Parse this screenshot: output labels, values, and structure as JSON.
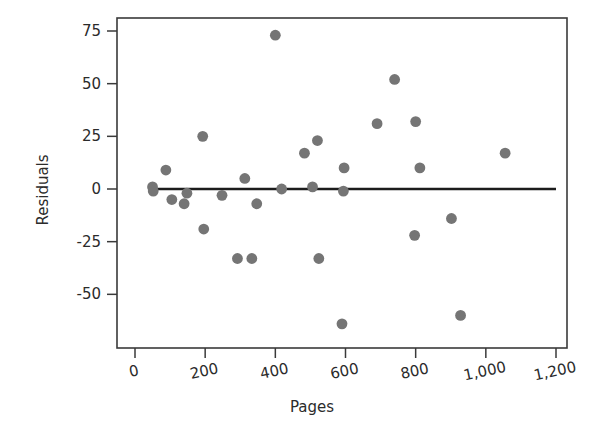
{
  "chart_data": {
    "type": "scatter",
    "title": "",
    "xlabel": "Pages",
    "ylabel": "Residuals",
    "xlim": [
      0,
      1200
    ],
    "ylim": [
      -75,
      85
    ],
    "grid": false,
    "legend": null,
    "xticks": [
      0,
      200,
      400,
      600,
      800,
      1000,
      1200
    ],
    "xticklabels": [
      "0",
      "200",
      "400",
      "600",
      "800",
      "1,000",
      "1,200"
    ],
    "yticks": [
      -50,
      -25,
      0,
      25,
      50,
      75
    ],
    "yticklabels": [
      "-50",
      "-25",
      "0",
      "25",
      "50",
      "75"
    ],
    "point_color": "#757575",
    "line_color": "#1c1c1c",
    "axis_color": "#3a3a3a",
    "reference_line": {
      "type": "horizontal",
      "y": 0,
      "x_start": 55,
      "x_end": 1200
    },
    "points": [
      {
        "x": 50,
        "y": 1
      },
      {
        "x": 52,
        "y": -1
      },
      {
        "x": 88,
        "y": 9
      },
      {
        "x": 105,
        "y": -5
      },
      {
        "x": 140,
        "y": -7
      },
      {
        "x": 148,
        "y": -2
      },
      {
        "x": 193,
        "y": 25
      },
      {
        "x": 196,
        "y": -19
      },
      {
        "x": 248,
        "y": -3
      },
      {
        "x": 292,
        "y": -33
      },
      {
        "x": 313,
        "y": 5
      },
      {
        "x": 333,
        "y": -33
      },
      {
        "x": 347,
        "y": -7
      },
      {
        "x": 400,
        "y": 73
      },
      {
        "x": 418,
        "y": 0
      },
      {
        "x": 483,
        "y": 17
      },
      {
        "x": 506,
        "y": 1
      },
      {
        "x": 520,
        "y": 23
      },
      {
        "x": 524,
        "y": -33
      },
      {
        "x": 590,
        "y": -64
      },
      {
        "x": 594,
        "y": -1
      },
      {
        "x": 596,
        "y": 10
      },
      {
        "x": 690,
        "y": 31
      },
      {
        "x": 740,
        "y": 52
      },
      {
        "x": 797,
        "y": -22
      },
      {
        "x": 800,
        "y": 32
      },
      {
        "x": 812,
        "y": 10
      },
      {
        "x": 902,
        "y": -14
      },
      {
        "x": 928,
        "y": -60
      },
      {
        "x": 1055,
        "y": 17
      }
    ]
  },
  "axes": {
    "x_axis_label": "Pages",
    "y_axis_label": "Residuals"
  }
}
